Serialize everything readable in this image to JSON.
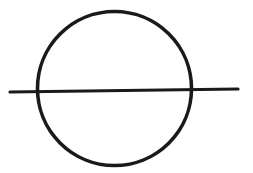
{
  "diagram": {
    "stroke_color": "#1a1a1a",
    "background": "#ffffff",
    "circle": {
      "cx": 114.5,
      "cy": 88.5,
      "rx": 77,
      "ry": 77,
      "stroke_width": 3.6
    },
    "line": {
      "x1": 10,
      "y1": 92,
      "x2": 238,
      "y2": 89,
      "stroke_width": 3.2
    }
  }
}
